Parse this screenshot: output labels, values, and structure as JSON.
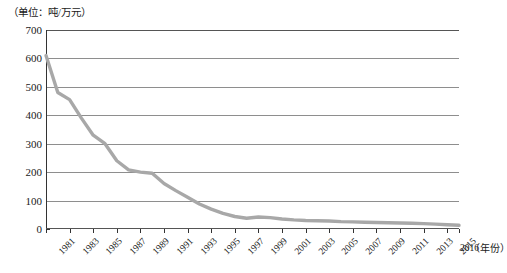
{
  "unit_caption": "（单位：吨/万元）",
  "x_axis_title": "（年份）",
  "series_color": "#a8a8a8",
  "grid_color": "#8e8e8e",
  "axis_color": "#333333",
  "chart_data": {
    "type": "line",
    "title": "",
    "subtitle": "",
    "xlabel": "（年份）",
    "ylabel": "",
    "unit": "吨/万元",
    "grid": true,
    "legend": false,
    "xlim": [
      1981,
      2016
    ],
    "ylim": [
      0,
      700
    ],
    "yticks": [
      0,
      100,
      200,
      300,
      400,
      500,
      600,
      700
    ],
    "ytick_labels": [
      "0",
      "100",
      "200",
      "300",
      "400",
      "500",
      "600",
      "700"
    ],
    "xtick_labels": [
      "1981",
      "1983",
      "1985",
      "1987",
      "1989",
      "1991",
      "1993",
      "1995",
      "1997",
      "1999",
      "2001",
      "2003",
      "2005",
      "2007",
      "2009",
      "2011",
      "2013",
      "2015",
      "2016"
    ],
    "xtick_years": [
      1981,
      1983,
      1985,
      1987,
      1989,
      1991,
      1993,
      1995,
      1997,
      1999,
      2001,
      2003,
      2005,
      2007,
      2009,
      2011,
      2013,
      2015,
      2016
    ],
    "x": [
      1981,
      1982,
      1983,
      1984,
      1985,
      1986,
      1987,
      1988,
      1989,
      1990,
      1991,
      1992,
      1993,
      1994,
      1995,
      1996,
      1997,
      1998,
      1999,
      2000,
      2001,
      2002,
      2003,
      2004,
      2005,
      2006,
      2007,
      2008,
      2009,
      2010,
      2011,
      2012,
      2013,
      2014,
      2015,
      2016
    ],
    "values": [
      610,
      480,
      455,
      390,
      330,
      300,
      240,
      208,
      200,
      196,
      160,
      135,
      112,
      88,
      70,
      55,
      44,
      38,
      42,
      40,
      35,
      32,
      30,
      29,
      28,
      26,
      25,
      24,
      23,
      22,
      21,
      20,
      19,
      17,
      15,
      13
    ]
  }
}
